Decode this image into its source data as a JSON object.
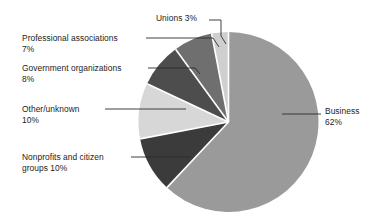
{
  "chart_data": {
    "type": "pie",
    "title": "",
    "subtitle": "",
    "xlabel": "",
    "ylabel": "",
    "legend_position": "callout-labels",
    "grid": false,
    "units": "percent",
    "total": 100,
    "start_angle_deg": 0,
    "direction": "clockwise",
    "categories": [
      "Business",
      "Nonprofits and citizen groups",
      "Other/unknown",
      "Government organizations",
      "Professional associations",
      "Unions"
    ],
    "values": [
      62,
      10,
      10,
      8,
      7,
      3
    ],
    "colors": [
      "#9a9a9a",
      "#3b3b3b",
      "#d7d7d7",
      "#4d4d4d",
      "#6f6f6f",
      "#cfcfcf"
    ],
    "slices": [
      {
        "label": "Business",
        "value": 62,
        "value_text": "62%",
        "color": "#9a9a9a"
      },
      {
        "label": "Nonprofits and citizen groups",
        "value": 10,
        "value_text": "10%",
        "color": "#3b3b3b"
      },
      {
        "label": "Other/unknown",
        "value": 10,
        "value_text": "10%",
        "color": "#d7d7d7"
      },
      {
        "label": "Government organizations",
        "value": 8,
        "value_text": "8%",
        "color": "#4d4d4d"
      },
      {
        "label": "Professional associations",
        "value": 7,
        "value_text": "7%",
        "color": "#6f6f6f"
      },
      {
        "label": "Unions",
        "value": 3,
        "value_text": "3%",
        "color": "#cfcfcf"
      }
    ]
  },
  "labels": {
    "unions": {
      "line1": "Unions  3%"
    },
    "professional_associations": {
      "line1": "Professional associations",
      "line2": "7%"
    },
    "government_organizations": {
      "line1": "Government organizations",
      "line2": "8%"
    },
    "other_unknown": {
      "line1": "Other/unknown",
      "line2": "10%"
    },
    "nonprofits": {
      "line1": "Nonprofits and citizen",
      "line2": "groups  10%"
    },
    "business": {
      "line1": "Business",
      "line2": "62%"
    }
  },
  "style": {
    "background": "#ffffff",
    "text_color": "#1c1c1c",
    "leader_line_color": "#2b2b2b",
    "slice_separator_color": "#ffffff"
  }
}
